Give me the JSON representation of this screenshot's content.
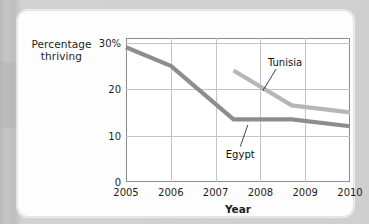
{
  "chart_data": {
    "type": "line",
    "title": "",
    "xlabel": "Year",
    "ylabel_lines": [
      "Percentage",
      "thriving"
    ],
    "xlim": [
      2005,
      2010
    ],
    "ylim": [
      0,
      31
    ],
    "grid": true,
    "legend_position": "inline-annotations",
    "x_ticks": [
      "2005",
      "2006",
      "2007",
      "2008",
      "2009",
      "2010"
    ],
    "x_tick_values": [
      2005,
      2006,
      2007,
      2008,
      2009,
      2010
    ],
    "y_ticks": [
      "0",
      "10",
      "20",
      "30%"
    ],
    "y_tick_values": [
      0,
      10,
      20,
      30
    ],
    "series": [
      {
        "name": "Egypt",
        "color": "#8d8d8d",
        "x": [
          2005,
          2006,
          2007.4,
          2008.7,
          2010
        ],
        "values": [
          29,
          25,
          13.5,
          13.5,
          12
        ]
      },
      {
        "name": "Tunisia",
        "color": "#b6b6b6",
        "x": [
          2007.4,
          2008.7,
          2010
        ],
        "values": [
          24,
          16.5,
          15
        ]
      }
    ],
    "annotations": [
      {
        "text": "Tunisia",
        "label_x": 2008.55,
        "label_y": 25.8,
        "leader_from_x": 2008.35,
        "leader_from_y": 24.3,
        "leader_to_x": 2008.05,
        "leader_to_y": 19.6
      },
      {
        "text": "Egypt",
        "label_x": 2007.55,
        "label_y": 6.0,
        "leader_from_x": 2007.55,
        "leader_from_y": 7.6,
        "leader_to_x": 2007.72,
        "leader_to_y": 12.3
      }
    ]
  }
}
